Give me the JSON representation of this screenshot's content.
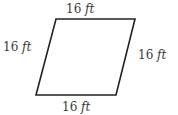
{
  "figure": {
    "shape": "rhombus",
    "stroke_color": "#222222",
    "vertices": [
      [
        56,
        19
      ],
      [
        135,
        19
      ],
      [
        116,
        95
      ],
      [
        36,
        95
      ]
    ]
  },
  "labels": {
    "top": {
      "value": "16",
      "unit": "ft"
    },
    "left": {
      "value": "16",
      "unit": "ft"
    },
    "right": {
      "value": "16",
      "unit": "ft"
    },
    "bottom": {
      "value": "16",
      "unit": "ft"
    }
  }
}
